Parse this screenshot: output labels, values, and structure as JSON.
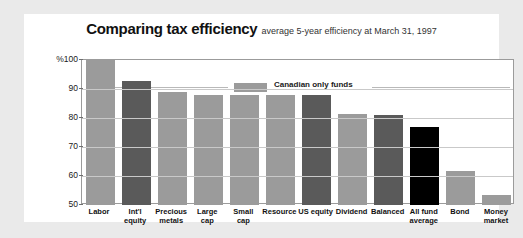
{
  "header": {
    "title": "Comparing tax efficiency",
    "subtitle": "average 5-year efficiency at March 31, 1997"
  },
  "legend": {
    "label": "Canadian only funds",
    "swatch_color": "#9b9b9b"
  },
  "colors": {
    "light_gray": "#9b9b9b",
    "dark_gray": "#5a5a5a",
    "black": "#000000",
    "gridline": "#c9c9c9",
    "frame": "#9b9b9b",
    "card_bg": "#ffffff",
    "page_bg": "#eaeaea"
  },
  "chart_data": {
    "type": "bar",
    "title": "Comparing tax efficiency",
    "subtitle": "average 5-year efficiency at March 31, 1997",
    "xlabel": "",
    "ylabel": "%",
    "ylim": [
      50,
      100
    ],
    "yticks": [
      50,
      60,
      70,
      80,
      90,
      100
    ],
    "ytick_labels": [
      "50",
      "60",
      "70",
      "80",
      "90",
      "%100"
    ],
    "grid": true,
    "legend": {
      "entries": [
        "Canadian only funds"
      ],
      "position": "top-right-inside"
    },
    "categories": [
      "Labor",
      "Int'l equity",
      "Precious metals",
      "Large cap",
      "Small cap",
      "Resource",
      "US equity",
      "Dividend",
      "Balanced",
      "All fund average",
      "Bond",
      "Money market"
    ],
    "category_lines": [
      [
        "Labor"
      ],
      [
        "Int'l",
        "equity"
      ],
      [
        "Precious",
        "metals"
      ],
      [
        "Large",
        "cap"
      ],
      [
        "Small",
        "cap"
      ],
      [
        "Resource"
      ],
      [
        "US equity"
      ],
      [
        "Dividend"
      ],
      [
        "Balanced"
      ],
      [
        "All fund",
        "average"
      ],
      [
        "Bond"
      ],
      [
        "Money",
        "market"
      ]
    ],
    "values": [
      100,
      92.7,
      89,
      88,
      88,
      88,
      87.8,
      81.5,
      81,
      77,
      61.8,
      53.5
    ],
    "bar_colors": [
      "#9b9b9b",
      "#5a5a5a",
      "#9b9b9b",
      "#9b9b9b",
      "#9b9b9b",
      "#9b9b9b",
      "#5a5a5a",
      "#9b9b9b",
      "#5a5a5a",
      "#000000",
      "#9b9b9b",
      "#9b9b9b"
    ]
  }
}
